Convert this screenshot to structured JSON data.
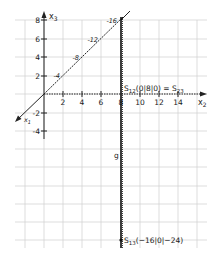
{
  "figure": {
    "type": "coordinate-diagram",
    "axes": {
      "x2": {
        "label": "x",
        "subscript": "2",
        "ticks": [
          "2",
          "4",
          "6",
          "8",
          "10",
          "12",
          "14"
        ]
      },
      "x3": {
        "label": "x",
        "subscript": "3",
        "ticks": [
          "8",
          "6",
          "4",
          "2",
          "-2",
          "-4"
        ]
      },
      "x1": {
        "label": "x",
        "subscript": "1",
        "ticks": [
          "-4",
          "-8",
          "-12",
          "-16"
        ]
      }
    },
    "line_label": "g",
    "points": [
      {
        "name": "S",
        "sub": "12",
        "coords": "(0|8|0) = S",
        "sub2": "23"
      },
      {
        "name": "S",
        "sub": "13",
        "coords": "(−16|0|−24)"
      }
    ],
    "colors": {
      "grid": "#c8c8c8",
      "axis": "#222222",
      "line": "#111111"
    }
  }
}
